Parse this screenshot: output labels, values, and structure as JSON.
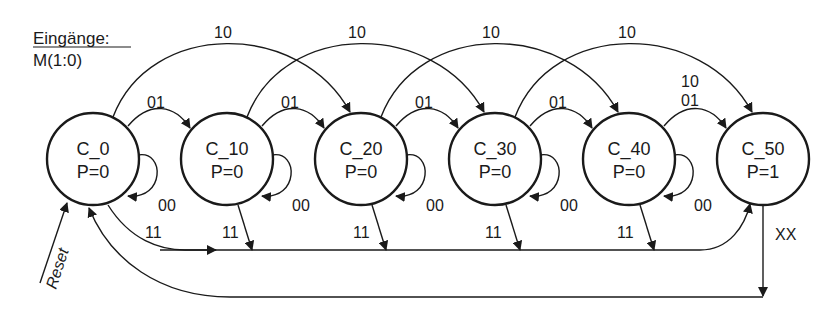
{
  "legend": {
    "title": "Eingänge:",
    "signal": "M(1:0)"
  },
  "states": [
    {
      "name": "C_0",
      "output": "P=0",
      "cx": 93
    },
    {
      "name": "C_10",
      "output": "P=0",
      "cx": 227
    },
    {
      "name": "C_20",
      "output": "P=0",
      "cx": 361
    },
    {
      "name": "C_30",
      "output": "P=0",
      "cx": 495
    },
    {
      "name": "C_40",
      "output": "P=0",
      "cx": 629
    },
    {
      "name": "C_50",
      "output": "P=1",
      "cx": 763
    }
  ],
  "transitions": {
    "self_loop": "00",
    "step_10": "01",
    "step_20": "10",
    "to_c50_from_c40": "10\n01",
    "to_c50_double_top": "10",
    "to_c50_double_bottom": "01",
    "return_11": "11",
    "reset_from_c50": "XX",
    "reset": "Reset"
  },
  "labels": {
    "l10_a": "10",
    "l10_b": "10",
    "l10_c": "10",
    "l10_d": "10",
    "l01_a": "01",
    "l01_b": "01",
    "l01_c": "01",
    "l01_d": "01",
    "l00_a": "00",
    "l00_b": "00",
    "l00_c": "00",
    "l00_d": "00",
    "l00_e": "00",
    "l11_a": "11",
    "l11_b": "11",
    "l11_c": "11",
    "l11_d": "11",
    "l11_e": "11",
    "c50_top": "10",
    "c50_bottom": "01",
    "xx": "XX",
    "reset": "Reset"
  }
}
